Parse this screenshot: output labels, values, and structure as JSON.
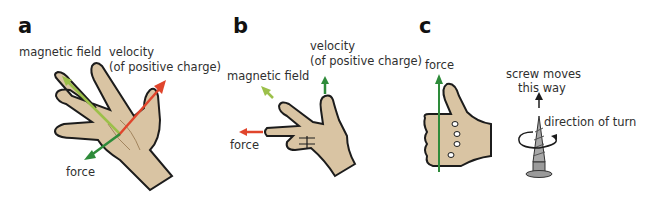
{
  "panels": [
    {
      "letter": "a",
      "labels": {
        "magnetic_field": "magnetic field",
        "velocity_line1": "velocity",
        "velocity_line2": "(of positive charge)",
        "force": "force"
      }
    },
    {
      "letter": "b",
      "labels": {
        "velocity_line1": "velocity",
        "velocity_line2": "(of positive charge)",
        "magnetic_field": "magnetic field",
        "force": "force"
      }
    },
    {
      "letter": "c",
      "labels": {
        "force": "force",
        "screw_line1": "screw moves",
        "screw_line2": "this way",
        "direction": "direction of turn"
      }
    }
  ],
  "colors": {
    "skin": "#d9c4a3",
    "outline": "#1c1c1c",
    "magnetic_field_arrow": "#9cc04a",
    "velocity_arrow_a": "#e0452c",
    "force_arrow_a": "#2e8b3a",
    "velocity_arrow_b": "#2e8b3a",
    "force_arrow_b": "#e0452c",
    "force_arrow_c": "#2e8b3a",
    "screw": "#9a9a9a"
  }
}
